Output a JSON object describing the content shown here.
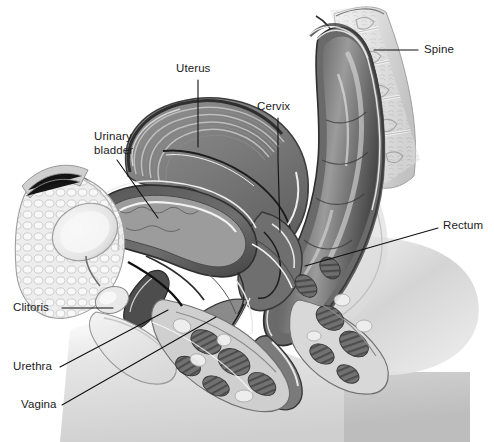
{
  "figure": {
    "style": "grayscale medical illustration",
    "background_color": "#ffffff",
    "label_color": "#1a1a1a",
    "leader_color": "#111111",
    "canvas": {
      "width": 494,
      "height": 442
    }
  },
  "labels": [
    {
      "id": "spine",
      "text": "Spine",
      "x": 424,
      "y": 43,
      "align": "left"
    },
    {
      "id": "uterus",
      "text": "Uterus",
      "x": 176,
      "y": 62,
      "align": "left"
    },
    {
      "id": "cervix",
      "text": "Cervix",
      "x": 257,
      "y": 100,
      "align": "left"
    },
    {
      "id": "urinary_bladder",
      "text": "Urinary\nbladder",
      "x": 94,
      "y": 130,
      "align": "left"
    },
    {
      "id": "rectum",
      "text": "Rectum",
      "x": 443,
      "y": 219,
      "align": "left"
    },
    {
      "id": "clitoris",
      "text": "Clitoris",
      "x": 13,
      "y": 301,
      "align": "left"
    },
    {
      "id": "urethra",
      "text": "Urethra",
      "x": 13,
      "y": 360,
      "align": "left"
    },
    {
      "id": "vagina",
      "text": "Vagina",
      "x": 21,
      "y": 398,
      "align": "left"
    }
  ],
  "leaders": [
    {
      "id": "spine-leader",
      "points": "374,50 418,50"
    },
    {
      "id": "uterus-leader",
      "points": "198,80 198,147"
    },
    {
      "id": "cervix-leader",
      "points": "278,118 278,160 280,232"
    },
    {
      "id": "bladder-leader",
      "points": "117,160 158,218"
    },
    {
      "id": "rectum-leader",
      "points": "438,228 305,266"
    },
    {
      "id": "clitoris-leader",
      "points": "62,308 113,308"
    },
    {
      "id": "urethra-leader",
      "points": "60,367 168,310"
    },
    {
      "id": "vagina-leader",
      "points": "62,405 216,317"
    }
  ],
  "anatomy_regions": [
    {
      "name": "spine",
      "tone": "light-gray vertebral column, upper right"
    },
    {
      "name": "rectum",
      "tone": "dark-gray lumen with specular highlights"
    },
    {
      "name": "uterus",
      "tone": "mid-gray layered myometrium, anteverted"
    },
    {
      "name": "urinary-bladder",
      "tone": "dark wall with pale mucosa"
    },
    {
      "name": "vagina",
      "tone": "narrow canal below cervix"
    },
    {
      "name": "pubic-fat",
      "tone": "pale lobulated fat, left"
    },
    {
      "name": "pelvic-floor-muscle",
      "tone": "dark striated muscle bundles"
    },
    {
      "name": "body-silhouette",
      "tone": "soft gray gradient, lower area"
    }
  ]
}
